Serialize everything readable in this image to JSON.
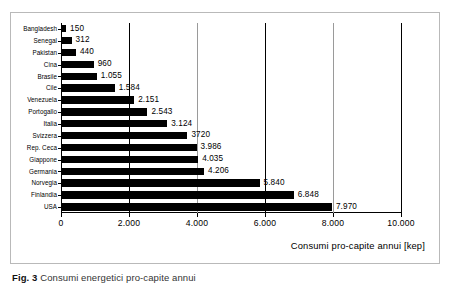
{
  "figure": {
    "caption_label": "Fig. 3",
    "caption_text": "Consumi energetici pro-capite annui"
  },
  "chart_data": {
    "type": "bar",
    "orientation": "horizontal",
    "title": "",
    "xlabel": "Consumi pro-capite annui [kep]",
    "ylabel": "",
    "xlim": [
      0,
      10000
    ],
    "grid": true,
    "legend_position": "none",
    "xticks": [
      0,
      2000,
      4000,
      6000,
      8000,
      10000
    ],
    "xtick_labels": [
      "0",
      "2.000",
      "4.000",
      "6.000",
      "8.000",
      "10.000"
    ],
    "categories": [
      "Bangladesh",
      "Senegal",
      "Pakistan",
      "Cina",
      "Brasile",
      "Cile",
      "Venezuela",
      "Portogallo",
      "Italia",
      "Svizzera",
      "Rep. Ceca",
      "Giappone",
      "Germania",
      "Norvegia",
      "Finlandia",
      "USA"
    ],
    "values": [
      150,
      312,
      440,
      960,
      1055,
      1584,
      2151,
      2543,
      3124,
      3720,
      3986,
      4035,
      4206,
      5840,
      6848,
      7970
    ],
    "value_labels": [
      "150",
      "312",
      "440",
      "960",
      "1.055",
      "1.584",
      "2.151",
      "2.543",
      "3.124",
      "3720",
      "3.986",
      "4.035",
      "4.206",
      "5.840",
      "6.848",
      "7.970"
    ],
    "bar_color": "#000000",
    "plot_background": "#ffffff"
  }
}
